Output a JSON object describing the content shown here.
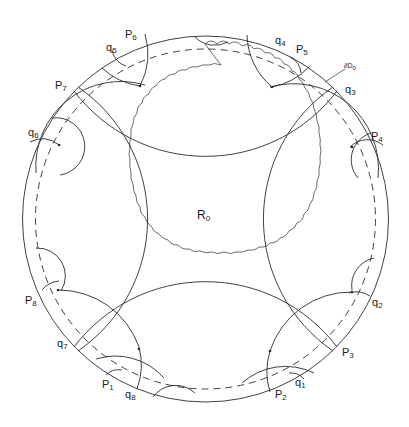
{
  "figure": {
    "type": "hyperbolic-disk-fundamental-domain",
    "center_region_label": {
      "base": "R",
      "sub": "0"
    },
    "boundary_label": {
      "base": "∂D",
      "sub": "0"
    },
    "colors": {
      "stroke": "#2b2b2b",
      "background": "#ffffff"
    },
    "p_labels": [
      {
        "base": "P",
        "sub": "1",
        "x": 102,
        "y": 387
      },
      {
        "base": "P",
        "sub": "2",
        "x": 275,
        "y": 397
      },
      {
        "base": "P",
        "sub": "3",
        "x": 342,
        "y": 343
      },
      {
        "base": "P",
        "sub": "4",
        "x": 370,
        "y": 131
      },
      {
        "base": "P",
        "sub": "5",
        "x": 296,
        "y": 46
      },
      {
        "base": "P",
        "sub": "6",
        "x": 125,
        "y": 30
      },
      {
        "base": "P",
        "sub": "7",
        "x": 53,
        "y": 81
      },
      {
        "base": "P",
        "sub": "8",
        "x": 24,
        "y": 294
      }
    ],
    "q_labels": [
      {
        "base": "q",
        "sub": "1",
        "x": 295,
        "y": 383
      },
      {
        "base": "q",
        "sub": "2",
        "x": 371,
        "y": 298
      },
      {
        "base": "q",
        "sub": "3",
        "x": 345,
        "y": 88
      },
      {
        "base": "q",
        "sub": "4",
        "x": 274,
        "y": 36
      },
      {
        "base": "q",
        "sub": "5",
        "x": 105,
        "y": 45
      },
      {
        "base": "q",
        "sub": "6",
        "x": 27,
        "y": 127
      },
      {
        "base": "q",
        "sub": "7",
        "x": 56,
        "y": 342
      },
      {
        "base": "q",
        "sub": "8",
        "x": 125,
        "y": 389
      }
    ]
  }
}
